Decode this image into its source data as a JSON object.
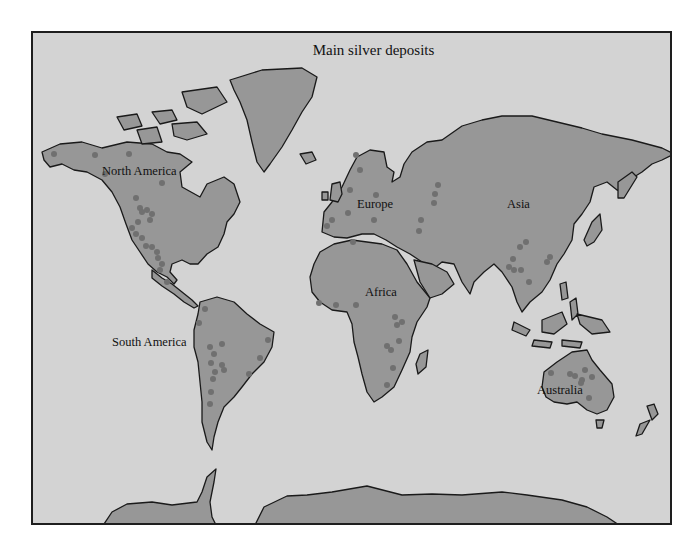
{
  "map": {
    "title": "Main silver deposits",
    "colors": {
      "ocean": "#d3d3d3",
      "land": "#979797",
      "deposit_dot": "#707070",
      "coastline": "#1a1a1a"
    },
    "regions": [
      {
        "name": "North America",
        "label": "North America"
      },
      {
        "name": "Europe",
        "label": "Europe"
      },
      {
        "name": "Asia",
        "label": "Asia"
      },
      {
        "name": "Africa",
        "label": "Africa"
      },
      {
        "name": "South America",
        "label": "South America"
      },
      {
        "name": "Australia",
        "label": "Australia"
      }
    ],
    "legend": {
      "dot_meaning": "silver deposit"
    }
  }
}
